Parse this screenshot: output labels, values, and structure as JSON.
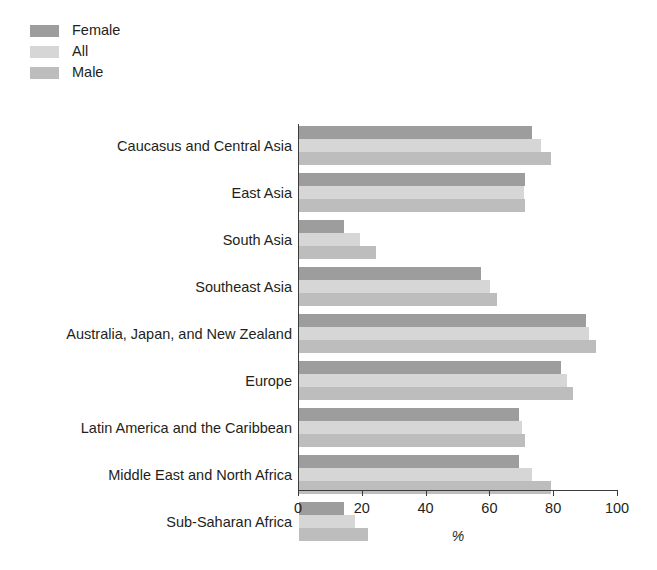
{
  "chart_data": {
    "type": "bar",
    "orientation": "horizontal",
    "title": "",
    "xlabel": "%",
    "ylabel": "",
    "xlim": [
      0,
      100
    ],
    "xticks": [
      0,
      20,
      40,
      60,
      80,
      100
    ],
    "grid": false,
    "legend_position": "top-left",
    "categories": [
      "Caucasus and Central Asia",
      "East Asia",
      "South Asia",
      "Southeast Asia",
      "Australia, Japan, and New Zealand",
      "Europe",
      "Latin America and the Caribbean",
      "Middle East and North Africa",
      "Sub-Saharan Africa"
    ],
    "series": [
      {
        "name": "Female",
        "color": "#9d9d9d",
        "values": [
          73,
          71,
          14,
          57,
          90,
          82,
          69,
          69,
          14
        ]
      },
      {
        "name": "All",
        "color": "#d6d6d6",
        "values": [
          76,
          70.5,
          19,
          60,
          91,
          84,
          70,
          73,
          17.5
        ]
      },
      {
        "name": "Male",
        "color": "#bdbdbd",
        "values": [
          79,
          71,
          24,
          62,
          93,
          86,
          71,
          79,
          21.5
        ]
      }
    ]
  },
  "legend": {
    "items": [
      {
        "label": "Female",
        "color": "#9d9d9d"
      },
      {
        "label": "All",
        "color": "#d6d6d6"
      },
      {
        "label": "Male",
        "color": "#bdbdbd"
      }
    ]
  },
  "axis": {
    "x_title": "%",
    "tick_labels": [
      "0",
      "20",
      "40",
      "60",
      "80",
      "100"
    ]
  }
}
